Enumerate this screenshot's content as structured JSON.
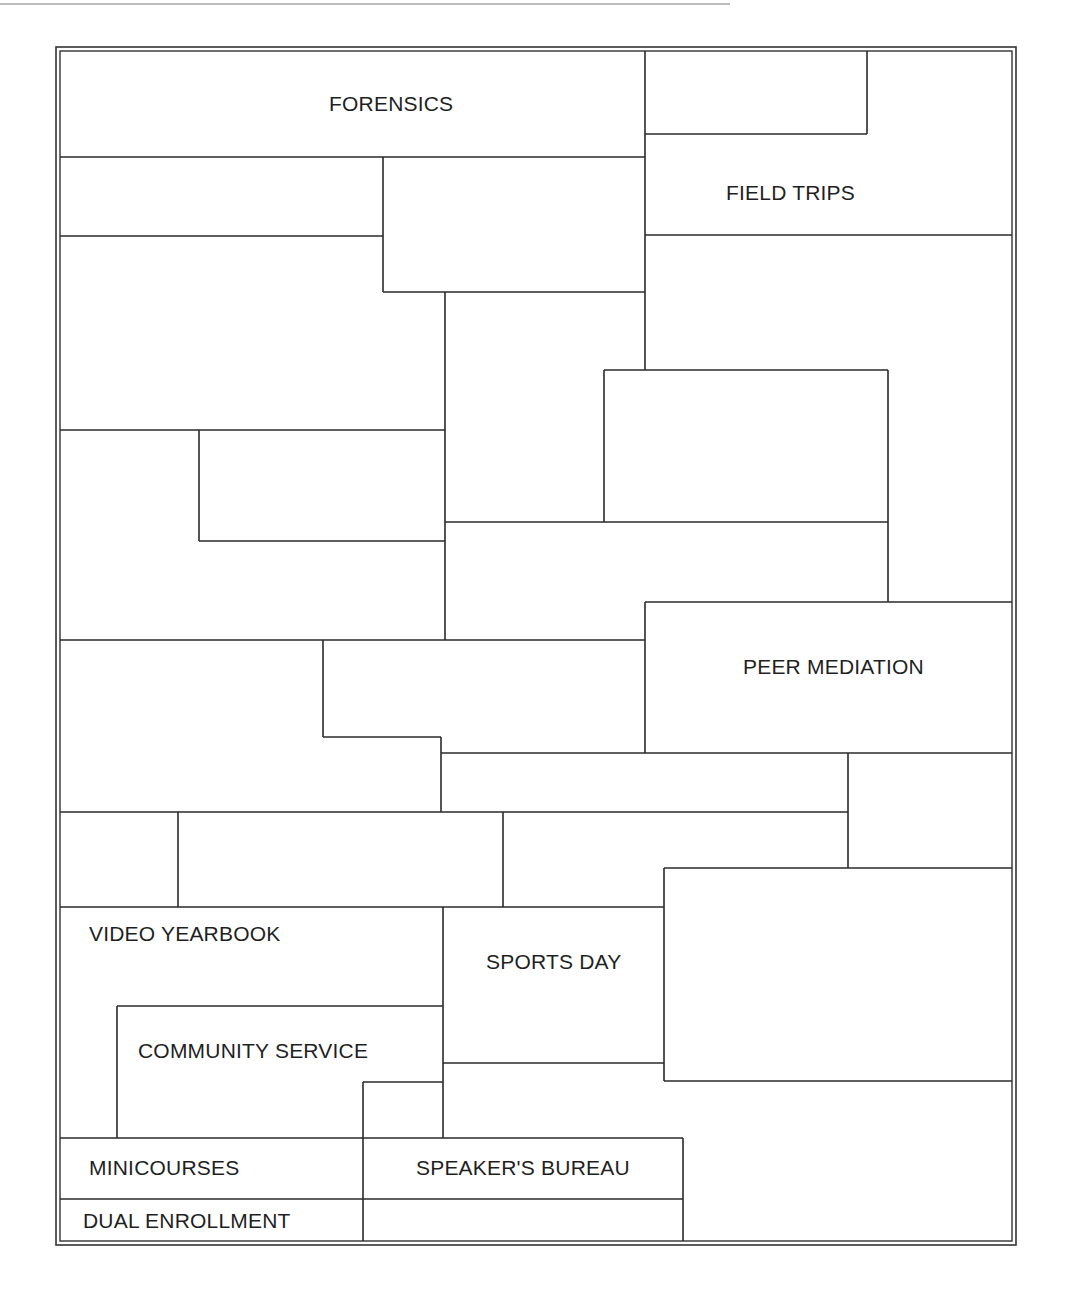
{
  "diagram": {
    "title": "",
    "labels": {
      "forensics": "FORENSICS",
      "field_trips": "FIELD TRIPS",
      "peer_mediation": "PEER MEDIATION",
      "video_yearbook": "VIDEO YEARBOOK",
      "sports_day": "SPORTS DAY",
      "community_service": "COMMUNITY SERVICE",
      "minicourses": "MINICOURSES",
      "speakers_bureau": "SPEAKER'S BUREAU",
      "dual_enrollment": "DUAL ENROLLMENT"
    },
    "colors": {
      "line": "#2a2a2a",
      "text": "#1f1f1f",
      "background": "#ffffff"
    }
  }
}
